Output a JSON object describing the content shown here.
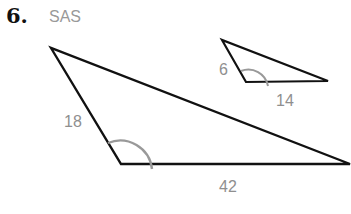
{
  "problem": {
    "number": "6.",
    "criterion": "SAS"
  },
  "large_triangle": {
    "side_left": "18",
    "side_bottom": "42",
    "included_angle_marked": true
  },
  "small_triangle": {
    "side_left": "6",
    "side_bottom": "14",
    "included_angle_marked": true
  },
  "colors": {
    "stroke": "#111111",
    "angle_arc": "#999999",
    "label": "#8f8f8f"
  }
}
